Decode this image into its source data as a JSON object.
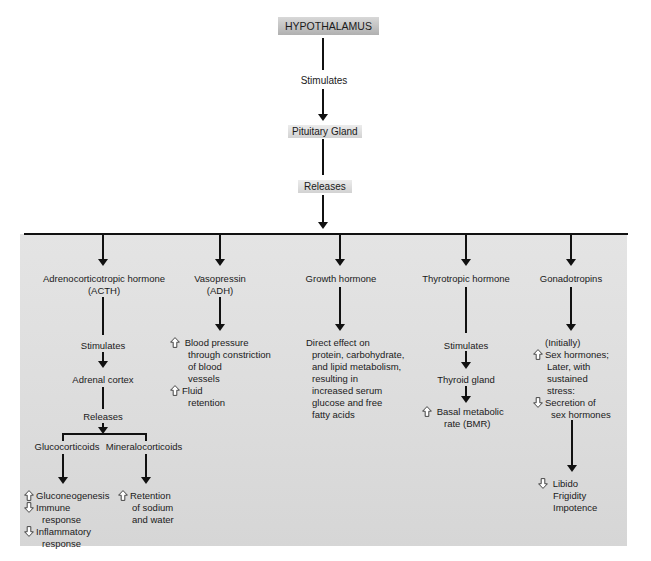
{
  "top": {
    "hypothalamus": "HYPOTHALAMUS",
    "stimulates": "Stimulates",
    "pituitary": "Pituitary Gland",
    "releases": "Releases"
  },
  "colors": {
    "panel_bg": "#dcdcdc",
    "line": "#111111",
    "hypothalamus_box": "#b8b8b8"
  },
  "branches": [
    {
      "title_line1": "Adrenocorticotropic hormone",
      "title_line2": "(ACTH)",
      "stimulates": "Stimulates",
      "target": "Adrenal cortex",
      "releases": "Releases",
      "sub": [
        {
          "label": "Glucocorticoids",
          "effects": [
            {
              "icon": "up-arrow-icon",
              "lines": [
                "Gluconeogenesis"
              ]
            },
            {
              "icon": "down-arrow-icon",
              "lines": [
                "Immune",
                "response"
              ]
            },
            {
              "icon": "down-arrow-icon",
              "lines": [
                "Inflammatory",
                "response"
              ]
            }
          ]
        },
        {
          "label": "Mineralocorticoids",
          "effects": [
            {
              "icon": "up-arrow-icon",
              "lines": [
                "Retention",
                "of sodium",
                "and water"
              ]
            }
          ]
        }
      ]
    },
    {
      "title_line1": "Vasopressin",
      "title_line2": "(ADH)",
      "effects": [
        {
          "icon": "up-arrow-icon",
          "lines": [
            "Blood pressure",
            "through constriction",
            "of blood",
            "vessels"
          ]
        },
        {
          "icon": "up-arrow-icon",
          "lines": [
            "Fluid",
            "retention"
          ]
        }
      ]
    },
    {
      "title_line1": "Growth hormone",
      "effect_lines": [
        "Direct effect on",
        "protein, carbohydrate,",
        "and lipid metabolism,",
        "resulting in",
        "increased serum",
        "glucose and free",
        "fatty acids"
      ]
    },
    {
      "title_line1": "Thyrotropic hormone",
      "stimulates": "Stimulates",
      "target": "Thyroid gland",
      "effects": [
        {
          "icon": "up-arrow-icon",
          "lines": [
            "Basal metabolic",
            "rate (BMR)"
          ]
        }
      ]
    },
    {
      "title_line1": "Gonadotropins",
      "initially": "(Initially)",
      "effects": [
        {
          "icon": "up-arrow-icon",
          "lines": [
            "Sex hormones;",
            "Later, with",
            "sustained",
            "stress:"
          ]
        },
        {
          "icon": "down-arrow-icon",
          "lines": [
            "Secretion of",
            "sex hormones"
          ]
        }
      ],
      "final": {
        "icon": "down-arrow-icon",
        "lines": [
          "Libido",
          "Frigidity",
          "Impotence"
        ]
      }
    }
  ]
}
